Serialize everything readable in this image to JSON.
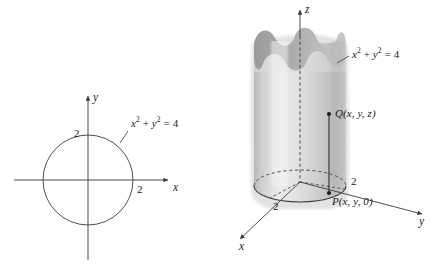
{
  "figure": {
    "name": "cylinder-and-circle-figure",
    "background_color": "#ffffff",
    "stroke_color": "#3a3a3a",
    "text_color": "#1a1a1a"
  },
  "panel_2d": {
    "name": "xy-plane-circle-diagram",
    "equation_label": {
      "base": "x",
      "exp1": "2",
      "plus": " + ",
      "var2": "y",
      "exp2": "2",
      "equals": " = 4",
      "full_text": "x² + y² = 4"
    },
    "axes": {
      "x_label": "x",
      "y_label": "y"
    },
    "ticks": {
      "x_tick": "2",
      "y_tick": "2"
    },
    "circle": {
      "radius_units": 2,
      "center": [
        0,
        0
      ]
    }
  },
  "panel_3d": {
    "name": "cylinder-diagram",
    "equation_label": {
      "base": "x",
      "exp1": "2",
      "plus": " + ",
      "var2": "y",
      "exp2": "2",
      "equals": " = 4",
      "full_text": "x² + y² = 4"
    },
    "axes": {
      "x_label": "x",
      "y_label": "y",
      "z_label": "z"
    },
    "ticks": {
      "x_tick": "2",
      "y_tick": "2"
    },
    "points": {
      "q_name": "Q",
      "q_coords": "(x, y, z)",
      "p_name": "P",
      "p_coords": "(x, y, 0)"
    },
    "surface": {
      "fill_light": "#e8e8e8",
      "fill_mid": "#cfcfcf",
      "fill_dark": "#b0b0b0",
      "fill_top": "#a8a8a8"
    }
  }
}
